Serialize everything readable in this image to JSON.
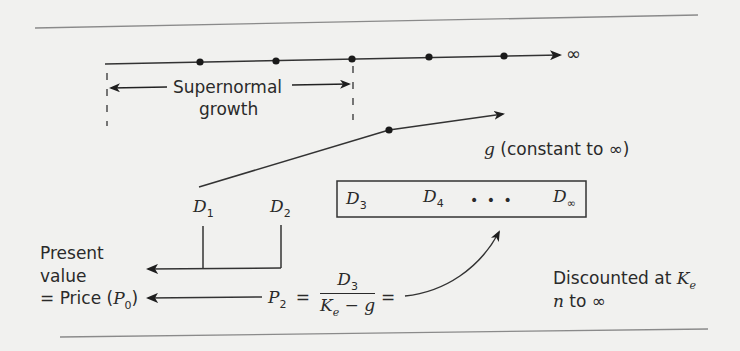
{
  "diagram": {
    "timeline": {
      "end_label": "∞",
      "period_dots": 5
    },
    "supernormal": {
      "line1": "Supernormal",
      "line2": "growth"
    },
    "growth_label": {
      "g": "g",
      "text": " (constant to ∞)"
    },
    "dividends": {
      "d1": {
        "base": "D",
        "sub": "1"
      },
      "d2": {
        "base": "D",
        "sub": "2"
      }
    },
    "box": {
      "d3": {
        "base": "D",
        "sub": "3"
      },
      "d4": {
        "base": "D",
        "sub": "4"
      },
      "ellipsis": "•   •   •",
      "dinf": {
        "base": "D",
        "sub": "∞"
      }
    },
    "present_value": {
      "line1": "Present",
      "line2": "value",
      "line3_prefix": "= Price (",
      "p0_base": "P",
      "p0_sub": "0",
      "line3_suffix": ")"
    },
    "formula": {
      "lhs_base": "P",
      "lhs_sub": "2",
      "equals": "=",
      "num_base": "D",
      "num_sub": "3",
      "den_k": "K",
      "den_k_sub": "e",
      "den_rest": " − g",
      "equals2": "="
    },
    "discount": {
      "line1": "Discounted at ",
      "ke_base": "K",
      "ke_sub": "e",
      "line2_n": "n",
      "line2_rest": " to ∞"
    },
    "colors": {
      "background": "#f1f1ef",
      "ink": "#2a2a2a",
      "rule": "#8a8a8a"
    }
  }
}
